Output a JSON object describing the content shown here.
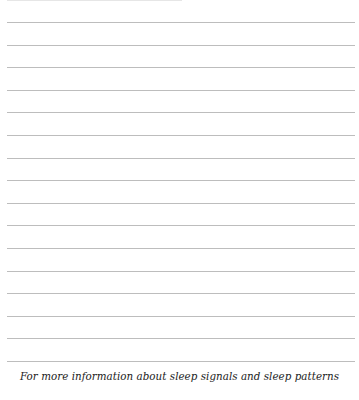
{
  "page": {
    "ruled_lines": 16,
    "line_color": "#bdbdbd",
    "footer_text": "For more information about sleep signals and sleep patterns"
  }
}
